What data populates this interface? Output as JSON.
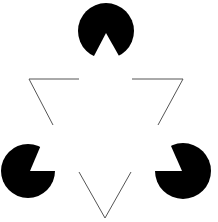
{
  "figure": {
    "colors": {
      "fill": "#000000",
      "line": "#555555",
      "background": "#ffffff"
    },
    "pacmen": [
      {
        "cx": 106,
        "cy": 31,
        "r": 28,
        "apex": [
          106,
          33
        ],
        "p1": [
          94,
          56
        ],
        "p2": [
          119,
          56
        ]
      },
      {
        "cx": 28,
        "cy": 171,
        "r": 27,
        "apex": [
          30,
          171
        ],
        "p1": [
          41,
          145
        ],
        "p2": [
          55,
          171
        ]
      },
      {
        "cx": 183,
        "cy": 171,
        "r": 28,
        "apex": [
          182,
          171
        ],
        "p1": [
          171,
          146
        ],
        "p2": [
          156,
          171
        ]
      }
    ],
    "outline_segments": [
      [
        [
          79,
          79
        ],
        [
          29,
          79
        ],
        [
          53,
          125
        ]
      ],
      [
        [
          132,
          79
        ],
        [
          183,
          79
        ],
        [
          158,
          125
        ]
      ],
      [
        [
          79,
          172
        ],
        [
          105,
          218
        ],
        [
          131,
          172
        ]
      ]
    ]
  }
}
